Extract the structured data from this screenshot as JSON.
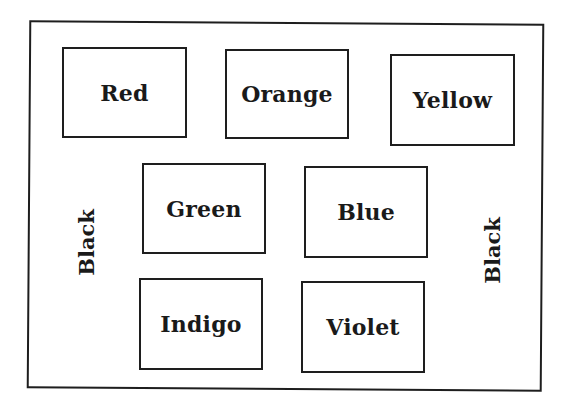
{
  "diagram": {
    "type": "labeled-boxes-in-frame",
    "frame_label_left": "Black",
    "frame_label_right": "Black",
    "boxes": [
      {
        "label": "Red",
        "row": 1,
        "col": 1
      },
      {
        "label": "Orange",
        "row": 1,
        "col": 2
      },
      {
        "label": "Yellow",
        "row": 1,
        "col": 3
      },
      {
        "label": "Green",
        "row": 2,
        "col": 1
      },
      {
        "label": "Blue",
        "row": 2,
        "col": 2
      },
      {
        "label": "Indigo",
        "row": 3,
        "col": 1
      },
      {
        "label": "Violet",
        "row": 3,
        "col": 2
      }
    ]
  }
}
